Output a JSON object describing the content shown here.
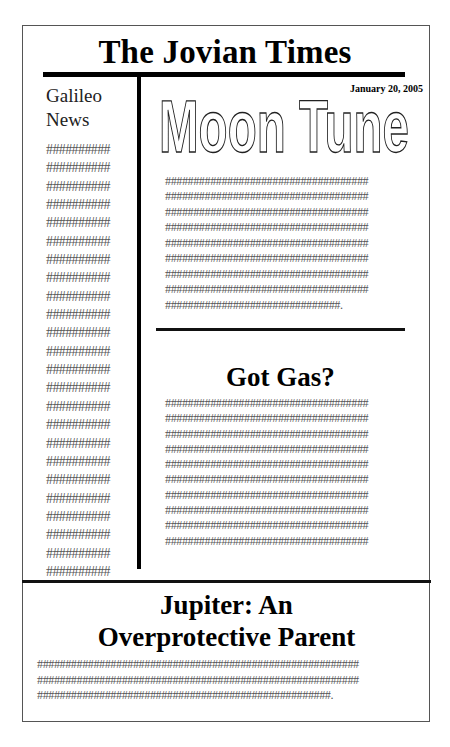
{
  "masthead": {
    "title": "The Jovian Times"
  },
  "sidebar": {
    "title_line1": "Galileo",
    "title_line2": "News",
    "lines": [
      "##########",
      "##########",
      "##########",
      "##########",
      "##########",
      "##########",
      "##########",
      "##########",
      "##########",
      "##########",
      "##########",
      "##########",
      "##########",
      "##########",
      "##########",
      "##########",
      "##########",
      "##########",
      "##########",
      "##########",
      "##########",
      "##########",
      "##########",
      "##########"
    ]
  },
  "date": "January 20, 2005",
  "moon_article": {
    "headline": "Moon Tune",
    "lines": [
      "####################################",
      "####################################",
      "####################################",
      "####################################",
      "####################################",
      "####################################",
      "####################################",
      "####################################",
      "###############################."
    ]
  },
  "gas_article": {
    "headline": "Got Gas?",
    "lines": [
      "####################################",
      "####################################",
      "####################################",
      "####################################",
      "####################################",
      "####################################",
      "####################################",
      "####################################",
      "####################################",
      "####################################"
    ]
  },
  "jupiter_article": {
    "headline_line1": "Jupiter: An",
    "headline_line2": "Overprotective Parent",
    "lines": [
      "#########################################################",
      "#########################################################",
      "####################################################."
    ]
  }
}
